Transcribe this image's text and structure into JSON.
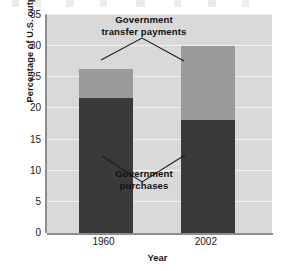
{
  "chart_data": {
    "type": "bar",
    "stacked": true,
    "title": "",
    "xlabel": "Year",
    "ylabel": "Percentage of U.S. output",
    "categories": [
      "1960",
      "2002"
    ],
    "ylim": [
      0,
      35
    ],
    "ytick_step": 5,
    "yticks": [
      "0",
      "5",
      "10",
      "15",
      "20",
      "25",
      "30",
      "35"
    ],
    "grid": true,
    "legend_position": "annotations-inline",
    "series": [
      {
        "name": "Government purchases",
        "color": "#3a3a3a",
        "values": [
          21.7,
          18.2
        ]
      },
      {
        "name": "Government transfer payments",
        "color": "#9a9a9a",
        "values": [
          4.6,
          11.9
        ]
      }
    ],
    "totals": [
      26.3,
      30.1
    ],
    "annotations": [
      {
        "text": "Government transfer payments",
        "target_series": "Government transfer payments"
      },
      {
        "text": "Government purchases",
        "target_series": "Government purchases"
      }
    ]
  },
  "axes": {
    "y_title": "Percentage of U.S. output",
    "x_title": "Year"
  },
  "annotations": {
    "transfers_line1": "Government",
    "transfers_line2": "transfer payments",
    "purchases_line1": "Government",
    "purchases_line2": "purchases"
  },
  "colors": {
    "plot_background": "#d9d9d9",
    "gridline": "#f2f2f2",
    "purchases": "#3a3a3a",
    "transfers": "#9a9a9a",
    "axis": "#8d8d8d",
    "text": "#1a1a1a"
  }
}
